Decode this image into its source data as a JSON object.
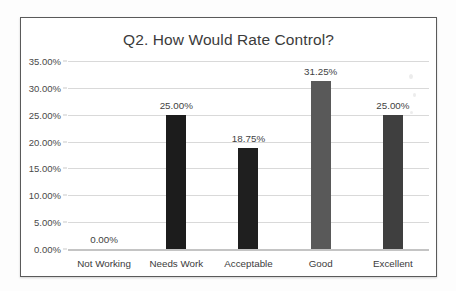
{
  "chart_data": {
    "type": "bar",
    "title": "Q2. How Would Rate Control?",
    "xlabel": "",
    "ylabel": "",
    "categories": [
      "Not Working",
      "Needs Work",
      "Acceptable",
      "Good",
      "Excellent"
    ],
    "values": [
      0,
      25,
      18.75,
      31.25,
      25
    ],
    "value_labels": [
      "0.00%",
      "25.00%",
      "18.75%",
      "31.25%",
      "25.00%"
    ],
    "ylim": [
      0,
      35
    ],
    "ytick_values": [
      0,
      5,
      10,
      15,
      20,
      25,
      30,
      35
    ],
    "ytick_labels": [
      "0.00%",
      "5.00%",
      "10.00%",
      "15.00%",
      "20.00%",
      "25.00%",
      "30.00%",
      "35.00%"
    ],
    "grid": true,
    "legend": false,
    "legend_position": "none",
    "bar_colors": [
      "#1c1c1c",
      "#1c1c1c",
      "#1f1f1f",
      "#595959",
      "#3f3f3f"
    ],
    "series": [
      {
        "name": "Response share",
        "values": [
          0,
          25,
          18.75,
          31.25,
          25
        ]
      }
    ]
  },
  "colors": {
    "frame_border": "#5a5a5a",
    "gridline": "#d9d9d9",
    "baseline": "#c4c4c4",
    "title_text": "#3b3b3b",
    "axis_text": "#4a4a4a",
    "page_background": "#fdfdfd",
    "plot_background": "#ffffff"
  }
}
